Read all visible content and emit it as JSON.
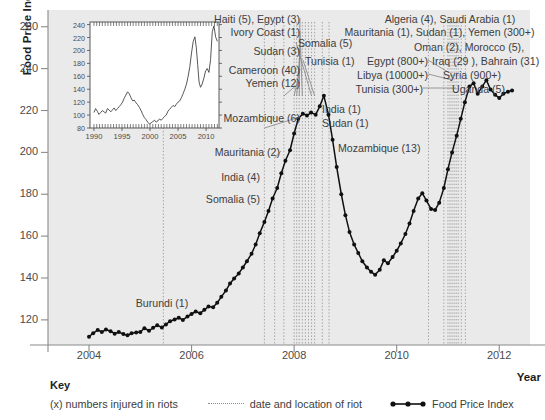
{
  "axes": {
    "ylabel": "Food Price Index",
    "xlabel": "Year",
    "yticks": [
      260,
      240,
      220,
      200,
      180,
      160,
      140,
      120
    ],
    "xticks": [
      2004,
      2006,
      2008,
      2010,
      2012
    ]
  },
  "key": {
    "title": "Key",
    "item_injured": "(x) numbers injured in riots",
    "item_riot": "date and location of riot",
    "item_fpi": "Food Price Index"
  },
  "inset": {
    "yticks": [
      240,
      220,
      200,
      180,
      160,
      140,
      120,
      100,
      80
    ],
    "xticks": [
      1990,
      1995,
      2000,
      2005,
      2010
    ]
  },
  "annotations": [
    {
      "id": "haiti-egypt",
      "text": "Haiti (5), Egypt (3)"
    },
    {
      "id": "ivory-coast",
      "text": "Ivory Coast (1)"
    },
    {
      "id": "sudan-3",
      "text": "Sudan (3)"
    },
    {
      "id": "cameroon",
      "text": "Cameroon (40)"
    },
    {
      "id": "yemen-12",
      "text": "Yemen (12)"
    },
    {
      "id": "mozambique-6",
      "text": "Mozambique (6)"
    },
    {
      "id": "mauritania-2",
      "text": "Mauritania (2)"
    },
    {
      "id": "india-4",
      "text": "India (4)"
    },
    {
      "id": "somalia-5-left",
      "text": "Somalia (5)"
    },
    {
      "id": "burundi",
      "text": "Burundi (1)"
    },
    {
      "id": "somalia-5-top",
      "text": "Somalia (5)"
    },
    {
      "id": "tunisia-1",
      "text": "Tunisia (1)"
    },
    {
      "id": "india-1",
      "text": "India (1)"
    },
    {
      "id": "sudan-1",
      "text": "Sudan (1)"
    },
    {
      "id": "mozambique-13",
      "text": "Mozambique (13)"
    },
    {
      "id": "algeria-saudi",
      "text": "Algeria (4), Saudi Arabia (1)"
    },
    {
      "id": "mauritania-sudan-yemen",
      "text": "Mauritania (1), Sudan (1), Yemen (300+)"
    },
    {
      "id": "oman-morocco",
      "text": "Oman (2), Morocco (5),"
    },
    {
      "id": "iraq-bahrain",
      "text": "Iraq (29 ), Bahrain (31)"
    },
    {
      "id": "egypt-800",
      "text": "Egypt (800+)"
    },
    {
      "id": "libya",
      "text": "Libya (10000+)"
    },
    {
      "id": "syria",
      "text": "Syria (900+)"
    },
    {
      "id": "tunisia-300",
      "text": "Tunisia (300+)"
    },
    {
      "id": "uganda",
      "text": "Uganda (5)"
    }
  ],
  "colors": {
    "plot_background": "#eaeaea",
    "series_line": "#101010",
    "riot_line": "#9a9a9a",
    "axis": "#8a8a8a",
    "text": "#3d3d3d"
  },
  "chart_data": {
    "type": "line",
    "title": "",
    "xlabel": "Year",
    "ylabel": "Food Price Index",
    "xlim": [
      2003.2,
      2012.6
    ],
    "ylim": [
      108,
      268
    ],
    "grid": false,
    "legend": "bottom",
    "series": [
      {
        "name": "Food Price Index",
        "x": [
          2004.0,
          2004.08,
          2004.17,
          2004.25,
          2004.33,
          2004.42,
          2004.5,
          2004.58,
          2004.67,
          2004.75,
          2004.83,
          2004.92,
          2005.0,
          2005.08,
          2005.17,
          2005.25,
          2005.33,
          2005.42,
          2005.5,
          2005.58,
          2005.67,
          2005.75,
          2005.83,
          2005.92,
          2006.0,
          2006.08,
          2006.17,
          2006.25,
          2006.33,
          2006.42,
          2006.5,
          2006.58,
          2006.67,
          2006.75,
          2006.83,
          2006.92,
          2007.0,
          2007.08,
          2007.17,
          2007.25,
          2007.33,
          2007.42,
          2007.5,
          2007.58,
          2007.67,
          2007.75,
          2007.83,
          2007.92,
          2008.0,
          2008.08,
          2008.17,
          2008.25,
          2008.33,
          2008.42,
          2008.5,
          2008.58,
          2008.67,
          2008.75,
          2008.83,
          2008.92,
          2009.0,
          2009.08,
          2009.17,
          2009.25,
          2009.33,
          2009.42,
          2009.5,
          2009.58,
          2009.67,
          2009.75,
          2009.83,
          2009.92,
          2010.0,
          2010.08,
          2010.17,
          2010.25,
          2010.33,
          2010.42,
          2010.5,
          2010.58,
          2010.67,
          2010.75,
          2010.83,
          2010.92,
          2011.0,
          2011.08,
          2011.17,
          2011.25,
          2011.33,
          2011.42,
          2011.5,
          2011.58,
          2011.67,
          2011.75,
          2011.83,
          2011.92,
          2012.0,
          2012.08,
          2012.17,
          2012.25
        ],
        "y": [
          112.0,
          113.6,
          115.2,
          114.2,
          115.4,
          114.6,
          113.4,
          114.2,
          113.2,
          112.6,
          113.6,
          114.0,
          114.2,
          116.0,
          114.8,
          116.2,
          117.4,
          116.4,
          117.8,
          119.4,
          120.2,
          121.0,
          120.0,
          121.6,
          122.8,
          124.0,
          123.2,
          124.8,
          126.4,
          126.0,
          128.2,
          131.0,
          134.0,
          137.4,
          139.8,
          142.2,
          145.0,
          148.0,
          151.6,
          156.0,
          161.4,
          166.8,
          172.0,
          178.0,
          183.0,
          190.0,
          196.0,
          201.0,
          209.0,
          216.0,
          218.5,
          217.6,
          219.0,
          218.0,
          222.0,
          227.0,
          218.0,
          206.0,
          193.0,
          180.0,
          170.0,
          162.0,
          156.0,
          152.0,
          148.0,
          145.0,
          143.0,
          141.5,
          144.0,
          148.5,
          147.0,
          150.0,
          153.0,
          156.5,
          161.0,
          166.0,
          172.0,
          178.0,
          180.5,
          177.0,
          173.0,
          172.5,
          176.0,
          183.0,
          192.0,
          200.0,
          208.0,
          216.0,
          224.0,
          231.5,
          233.0,
          228.0,
          231.5,
          234.5,
          230.0,
          227.5,
          226.0,
          228.0,
          229.0,
          229.5
        ]
      }
    ],
    "riot_events_x": [
      2005.45,
      2007.42,
      2007.62,
      2007.8,
      2008.0,
      2008.05,
      2008.1,
      2008.16,
      2008.22,
      2008.28,
      2008.34,
      2008.4,
      2008.55,
      2008.68,
      2010.62,
      2010.92,
      2011.0,
      2011.04,
      2011.08,
      2011.12,
      2011.16,
      2011.2,
      2011.26,
      2011.34
    ],
    "inset": {
      "type": "line",
      "xlim": [
        1989.3,
        2012.3
      ],
      "ylim": [
        80,
        244
      ],
      "x": [
        1990.0,
        1990.3,
        1990.6,
        1990.9,
        1991.2,
        1991.5,
        1991.8,
        1992.1,
        1992.4,
        1992.7,
        1993.0,
        1993.3,
        1993.6,
        1993.9,
        1994.2,
        1994.5,
        1994.8,
        1995.1,
        1995.4,
        1995.7,
        1996.0,
        1996.3,
        1996.6,
        1996.9,
        1997.2,
        1997.5,
        1997.8,
        1998.1,
        1998.4,
        1998.7,
        1999.0,
        1999.3,
        1999.6,
        1999.9,
        2000.2,
        2000.5,
        2000.8,
        2001.1,
        2001.4,
        2001.7,
        2002.0,
        2002.3,
        2002.6,
        2002.9,
        2003.2,
        2003.5,
        2003.8,
        2004.1,
        2004.4,
        2004.7,
        2005.0,
        2005.3,
        2005.6,
        2005.9,
        2006.2,
        2006.5,
        2006.8,
        2007.1,
        2007.4,
        2007.7,
        2008.0,
        2008.25,
        2008.5,
        2008.75,
        2009.0,
        2009.3,
        2009.6,
        2009.9,
        2010.2,
        2010.5,
        2010.8,
        2011.1,
        2011.4,
        2011.7,
        2012.0
      ],
      "y": [
        104,
        110,
        106,
        101,
        104,
        107,
        105,
        103,
        110,
        108,
        105,
        108,
        111,
        107,
        110,
        113,
        116,
        120,
        126,
        131,
        136,
        133,
        127,
        122,
        123,
        119,
        116,
        112,
        107,
        101,
        96,
        93,
        89,
        86,
        88,
        90,
        92,
        89,
        91,
        94,
        92,
        95,
        98,
        100,
        106,
        109,
        112,
        115,
        113,
        117,
        120,
        122,
        127,
        133,
        140,
        148,
        160,
        175,
        196,
        214,
        221,
        205,
        178,
        151,
        143,
        148,
        157,
        168,
        172,
        166,
        186,
        229,
        238,
        221,
        214
      ]
    }
  }
}
